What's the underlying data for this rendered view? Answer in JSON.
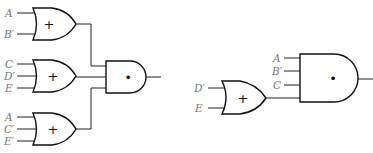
{
  "diagram": {
    "left_circuit": {
      "or_gates": [
        {
          "symbol": "+",
          "inputs": [
            "A",
            "B′"
          ]
        },
        {
          "symbol": "+",
          "inputs": [
            "C",
            "D′",
            "E"
          ]
        },
        {
          "symbol": "+",
          "inputs": [
            "A",
            "C′",
            "E′"
          ]
        }
      ],
      "and_gate": {
        "symbol": "•"
      }
    },
    "right_circuit": {
      "or_gate": {
        "symbol": "+",
        "inputs": [
          "D′",
          "E"
        ]
      },
      "and_gate": {
        "symbol": "•",
        "inputs": [
          "A",
          "B′",
          "C"
        ]
      }
    }
  }
}
